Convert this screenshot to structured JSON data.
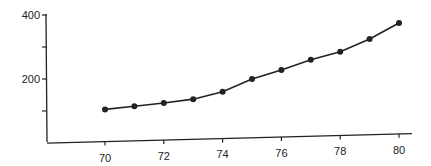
{
  "chart_data": {
    "type": "line",
    "title": "",
    "xlabel": "",
    "ylabel": "",
    "x": [
      70,
      71,
      72,
      73,
      74,
      75,
      76,
      77,
      78,
      79,
      80
    ],
    "values": [
      105,
      115,
      125,
      137,
      160,
      200,
      228,
      260,
      285,
      325,
      375
    ],
    "series": [
      {
        "name": "series",
        "values": [
          105,
          115,
          125,
          137,
          160,
          200,
          228,
          260,
          285,
          325,
          375
        ]
      }
    ],
    "xlim": [
      66,
      81
    ],
    "ylim": [
      0,
      400
    ],
    "x_ticks": [
      70,
      72,
      74,
      76,
      78,
      80
    ],
    "x_tick_labels": [
      "70",
      "72",
      "74",
      "76",
      "78",
      "80"
    ],
    "y_ticks": [
      100,
      200,
      300,
      400
    ],
    "y_tick_labels": [
      "",
      "200",
      "",
      "400"
    ],
    "grid": false,
    "legend": null,
    "line_color": "#222222",
    "marker": "circle"
  }
}
